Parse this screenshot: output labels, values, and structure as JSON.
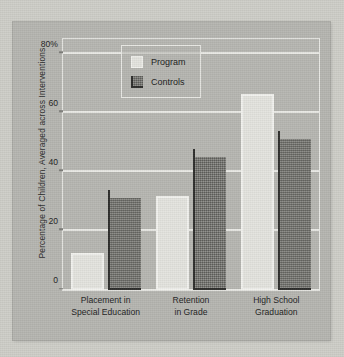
{
  "chart_data": {
    "type": "bar",
    "title": "",
    "xlabel": "",
    "ylabel": "Percentage of Children, Averaged across Interventions",
    "categories": [
      "Placement in\nSpecial Education",
      "Retention\nin Grade",
      "High School\nGraduation"
    ],
    "series": [
      {
        "name": "Program",
        "values": [
          12.5,
          32,
          66.5
        ],
        "color": "#e4e4df"
      },
      {
        "name": "Controls",
        "values": [
          31,
          45,
          51
        ],
        "color": "#767671"
      }
    ],
    "ylim": [
      0,
      85
    ],
    "yticks": [
      0,
      20,
      40,
      60,
      80
    ],
    "ytick_labels": [
      "0",
      "20",
      "40",
      "60",
      "80%"
    ],
    "grid": true,
    "legend_position": "top-left-inside"
  },
  "legend": {
    "entries": [
      {
        "label": "Program"
      },
      {
        "label": "Controls"
      }
    ]
  },
  "colors": {
    "page_background": "#cfcfc9",
    "panel_background": "#b6b6b1",
    "gridline": "#e9e9e5",
    "frame": "#e8e8e4",
    "program_bar": "#e4e4df",
    "controls_bar": "#767671",
    "controls_edge": "#2e2e2c",
    "text": "#232323"
  }
}
